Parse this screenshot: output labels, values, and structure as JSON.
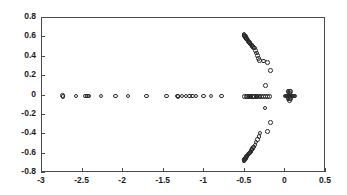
{
  "figure": {
    "width": 347,
    "height": 195,
    "background": "#ffffff",
    "axis_color": "#4a4a4a",
    "marker_color": "#2a2a2a"
  },
  "plot_area": {
    "left": 41,
    "top": 17,
    "right": 325,
    "bottom": 172
  },
  "chart_data": {
    "type": "scatter",
    "title": "",
    "subtitle": "",
    "xlabel": "",
    "ylabel": "",
    "grid": false,
    "legend": null,
    "marker_style": "open-circle",
    "marker_size_px": 4.6,
    "xlim": [
      -3,
      0.5
    ],
    "ylim": [
      -0.8,
      0.8
    ],
    "xticks": [
      -3,
      -2.5,
      -2,
      -1.5,
      -1,
      -0.5,
      0,
      0.5
    ],
    "xtick_labels": [
      "-3",
      "-2.5",
      "-2",
      "-1.5",
      "-1",
      "-0.5",
      "0",
      "0.5"
    ],
    "yticks": [
      -0.8,
      -0.6,
      -0.4,
      -0.2,
      0,
      0.2,
      0.4,
      0.6,
      0.8
    ],
    "ytick_labels": [
      "-0.8",
      "-0.6",
      "-0.4",
      "-0.2",
      "0",
      "0.2",
      "0.4",
      "0.6",
      "0.8"
    ],
    "series": [
      {
        "name": "eigenvalues",
        "points": [
          [
            -2.735,
            -0.012
          ],
          [
            -2.73,
            -0.018
          ],
          [
            -2.57,
            -0.015
          ],
          [
            -2.452,
            -0.015
          ],
          [
            -2.43,
            -0.015
          ],
          [
            -2.408,
            -0.015
          ],
          [
            -2.262,
            -0.015
          ],
          [
            -2.08,
            -0.015
          ],
          [
            -1.93,
            -0.015
          ],
          [
            -1.7,
            -0.015
          ],
          [
            -1.452,
            -0.015
          ],
          [
            -1.318,
            -0.015
          ],
          [
            -1.312,
            -0.02
          ],
          [
            -1.262,
            -0.015
          ],
          [
            -1.212,
            -0.015
          ],
          [
            -1.172,
            -0.015
          ],
          [
            -1.132,
            -0.015
          ],
          [
            -1.092,
            -0.015
          ],
          [
            -1.0,
            -0.015
          ],
          [
            -0.905,
            -0.015
          ],
          [
            -0.775,
            -0.015
          ],
          [
            -0.492,
            -0.018
          ],
          [
            -0.47,
            -0.018
          ],
          [
            -0.452,
            -0.018
          ],
          [
            -0.438,
            -0.018
          ],
          [
            -0.424,
            -0.018
          ],
          [
            -0.41,
            -0.018
          ],
          [
            -0.396,
            -0.018
          ],
          [
            -0.382,
            -0.018
          ],
          [
            -0.368,
            -0.018
          ],
          [
            -0.352,
            -0.018
          ],
          [
            -0.336,
            -0.018
          ],
          [
            -0.32,
            -0.018
          ],
          [
            -0.3,
            -0.018
          ],
          [
            -0.28,
            -0.018
          ],
          [
            -0.258,
            -0.018
          ],
          [
            -0.234,
            -0.018
          ],
          [
            -0.21,
            -0.018
          ],
          [
            -0.186,
            -0.018
          ],
          [
            0.02,
            -0.015
          ],
          [
            0.035,
            -0.015
          ],
          [
            0.048,
            -0.015
          ],
          [
            0.058,
            -0.015
          ],
          [
            0.068,
            -0.015
          ],
          [
            0.078,
            -0.015
          ],
          [
            0.088,
            -0.015
          ],
          [
            0.098,
            -0.015
          ],
          [
            0.11,
            -0.015
          ],
          [
            0.06,
            0.03
          ],
          [
            0.06,
            0.012
          ],
          [
            0.06,
            -0.042
          ],
          [
            0.06,
            -0.06
          ],
          [
            0.072,
            0.03
          ],
          [
            0.072,
            -0.045
          ],
          [
            0.045,
            0.03
          ],
          [
            0.045,
            -0.045
          ],
          [
            0.125,
            -0.015
          ],
          [
            0.03,
            -0.015
          ],
          [
            0.01,
            -0.015
          ],
          [
            -0.498,
            0.622
          ],
          [
            -0.495,
            0.612
          ],
          [
            -0.489,
            0.604
          ],
          [
            -0.483,
            0.596
          ],
          [
            -0.477,
            0.588
          ],
          [
            -0.471,
            0.58
          ],
          [
            -0.464,
            0.572
          ],
          [
            -0.458,
            0.564
          ],
          [
            -0.451,
            0.556
          ],
          [
            -0.444,
            0.548
          ],
          [
            -0.437,
            0.541
          ],
          [
            -0.43,
            0.534
          ],
          [
            -0.422,
            0.527
          ],
          [
            -0.414,
            0.52
          ],
          [
            -0.406,
            0.512
          ],
          [
            -0.398,
            0.505
          ],
          [
            -0.39,
            0.497
          ],
          [
            -0.381,
            0.488
          ],
          [
            -0.372,
            0.478
          ],
          [
            -0.358,
            0.455
          ],
          [
            -0.342,
            0.43
          ],
          [
            -0.33,
            0.402
          ],
          [
            -0.318,
            0.372
          ],
          [
            -0.306,
            0.352
          ],
          [
            -0.258,
            0.346
          ],
          [
            -0.207,
            0.33
          ],
          [
            -0.17,
            0.248
          ],
          [
            -0.232,
            0.095
          ],
          [
            -0.238,
            -0.14
          ],
          [
            -0.175,
            -0.288
          ],
          [
            -0.21,
            -0.382
          ],
          [
            -0.302,
            -0.398
          ],
          [
            -0.312,
            -0.432
          ],
          [
            -0.33,
            -0.462
          ],
          [
            -0.348,
            -0.492
          ],
          [
            -0.364,
            -0.52
          ],
          [
            -0.378,
            -0.54
          ],
          [
            -0.39,
            -0.556
          ],
          [
            -0.4,
            -0.568
          ],
          [
            -0.41,
            -0.58
          ],
          [
            -0.42,
            -0.592
          ],
          [
            -0.43,
            -0.604
          ],
          [
            -0.44,
            -0.614
          ],
          [
            -0.45,
            -0.624
          ],
          [
            -0.459,
            -0.633
          ],
          [
            -0.468,
            -0.642
          ],
          [
            -0.476,
            -0.65
          ],
          [
            -0.483,
            -0.658
          ],
          [
            -0.489,
            -0.666
          ],
          [
            -0.494,
            -0.674
          ],
          [
            -0.498,
            -0.682
          ],
          [
            -0.5,
            -0.688
          ]
        ]
      }
    ]
  }
}
